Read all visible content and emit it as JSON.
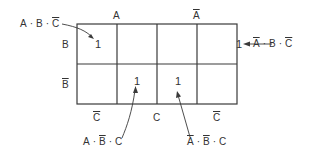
{
  "diagram": {
    "type": "karnaugh-map",
    "variables": [
      "A",
      "B",
      "C"
    ],
    "column_headers": {
      "top": [
        {
          "label": "A",
          "negated": false,
          "span": "columns 1-2"
        },
        {
          "label": "A",
          "negated": true,
          "span": "columns 3-4"
        }
      ],
      "bottom": [
        {
          "label": "C",
          "negated": true,
          "span": "column 1"
        },
        {
          "label": "C",
          "negated": false,
          "span": "columns 2-3"
        },
        {
          "label": "C",
          "negated": true,
          "span": "column 4"
        }
      ]
    },
    "row_headers": [
      {
        "label": "B",
        "negated": false
      },
      {
        "label": "B",
        "negated": true
      }
    ],
    "cells": [
      [
        "1",
        "",
        "",
        "1"
      ],
      [
        "",
        "1",
        "1",
        ""
      ]
    ],
    "annotations": [
      {
        "term": [
          {
            "v": "A",
            "n": false
          },
          {
            "v": "B",
            "n": false
          },
          {
            "v": "C",
            "n": true
          }
        ],
        "points_to": "row 1, column 1"
      },
      {
        "term": [
          {
            "v": "A",
            "n": true
          },
          {
            "v": "B",
            "n": false
          },
          {
            "v": "C",
            "n": true
          }
        ],
        "points_to": "row 1, column 4"
      },
      {
        "term": [
          {
            "v": "A",
            "n": false
          },
          {
            "v": "B",
            "n": true
          },
          {
            "v": "C",
            "n": false
          }
        ],
        "points_to": "row 2, column 2"
      },
      {
        "term": [
          {
            "v": "A",
            "n": true
          },
          {
            "v": "B",
            "n": true
          },
          {
            "v": "C",
            "n": false
          }
        ],
        "points_to": "row 2, column 3"
      }
    ],
    "labels": {
      "A": "A",
      "B": "B",
      "C": "C",
      "one": "1",
      "dot": "·"
    },
    "line_color": "#3a3a3a"
  }
}
